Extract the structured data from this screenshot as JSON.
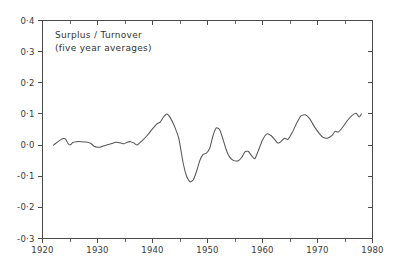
{
  "chart_data": {
    "type": "line",
    "title": "Surplus / Turnover",
    "subtitle": "(five year averages)",
    "xlabel": "",
    "ylabel": "",
    "xlim": [
      1920,
      1980
    ],
    "ylim": [
      -0.3,
      0.4
    ],
    "grid": false,
    "legend": "none",
    "y_tick_labels": [
      "0·4",
      "0·3",
      "0·2",
      "0·1",
      "0·0",
      "-0·1",
      "-0·2",
      "-0·3"
    ],
    "y_tick_values": [
      0.4,
      0.3,
      0.2,
      0.1,
      0.0,
      -0.1,
      -0.2,
      -0.3
    ],
    "x_tick_labels": [
      "1920",
      "1930",
      "1940",
      "1950",
      "1960",
      "1970",
      "1980"
    ],
    "x_tick_values": [
      1920,
      1930,
      1940,
      1950,
      1960,
      1970,
      1980
    ],
    "x_minor_tick_values": [
      1925,
      1935,
      1945,
      1955,
      1965,
      1975
    ],
    "series": [
      {
        "name": "Surplus / Turnover (five year averages)",
        "x": [
          1922,
          1922.6,
          1923.2,
          1923.8,
          1924.2,
          1924.6,
          1925.0,
          1925.5,
          1926.2,
          1927.0,
          1928.0,
          1928.8,
          1929.4,
          1930.0,
          1930.6,
          1931.4,
          1932.4,
          1933.4,
          1934.2,
          1934.8,
          1935.4,
          1936.0,
          1936.6,
          1937.2,
          1938.0,
          1939.0,
          1940.0,
          1940.8,
          1941.4,
          1942.0,
          1942.6,
          1943.2,
          1944.0,
          1944.8,
          1945.6,
          1946.2,
          1946.8,
          1947.4,
          1948.0,
          1948.6,
          1949.2,
          1949.8,
          1950.4,
          1951.0,
          1951.6,
          1952.2,
          1952.8,
          1953.4,
          1954.0,
          1954.8,
          1955.6,
          1956.2,
          1956.8,
          1957.4,
          1958.0,
          1958.6,
          1959.2,
          1960.0,
          1960.8,
          1961.6,
          1962.2,
          1962.8,
          1963.4,
          1964.0,
          1964.6,
          1965.4,
          1966.2,
          1967.0,
          1967.8,
          1968.6,
          1969.4,
          1970.2,
          1971.0,
          1971.8,
          1972.6,
          1973.2,
          1973.8,
          1974.6,
          1975.4,
          1976.2,
          1977.0,
          1977.6,
          1978.0
        ],
        "y": [
          0.0,
          0.008,
          0.016,
          0.021,
          0.019,
          0.006,
          0.0,
          0.008,
          0.011,
          0.011,
          0.01,
          0.005,
          -0.004,
          -0.007,
          -0.006,
          -0.001,
          0.004,
          0.009,
          0.007,
          0.004,
          0.009,
          0.011,
          0.007,
          0.0,
          0.012,
          0.03,
          0.052,
          0.068,
          0.074,
          0.09,
          0.1,
          0.089,
          0.06,
          0.02,
          -0.06,
          -0.1,
          -0.118,
          -0.112,
          -0.085,
          -0.05,
          -0.03,
          -0.026,
          -0.01,
          0.03,
          0.055,
          0.05,
          0.02,
          -0.015,
          -0.038,
          -0.05,
          -0.05,
          -0.04,
          -0.022,
          -0.02,
          -0.034,
          -0.044,
          -0.02,
          0.016,
          0.036,
          0.03,
          0.018,
          0.006,
          0.012,
          0.022,
          0.018,
          0.04,
          0.07,
          0.094,
          0.097,
          0.084,
          0.06,
          0.04,
          0.025,
          0.022,
          0.03,
          0.044,
          0.042,
          0.058,
          0.078,
          0.094,
          0.102,
          0.09,
          0.1
        ]
      }
    ]
  },
  "annotations": {
    "title_line1": "Surplus / Turnover",
    "title_line2": "(five year averages)"
  },
  "axes": {
    "y_labels": [
      "0·4",
      "0·3",
      "0·2",
      "0·1",
      "0·0",
      "-0·1",
      "-0·2",
      "-0·3"
    ],
    "x_labels": [
      "1920",
      "1930",
      "1940",
      "1950",
      "1960",
      "1970",
      "1980"
    ]
  },
  "colors": {
    "line": "#555555",
    "axis": "#4a4a4a",
    "text": "#333333",
    "background": "#ffffff"
  }
}
